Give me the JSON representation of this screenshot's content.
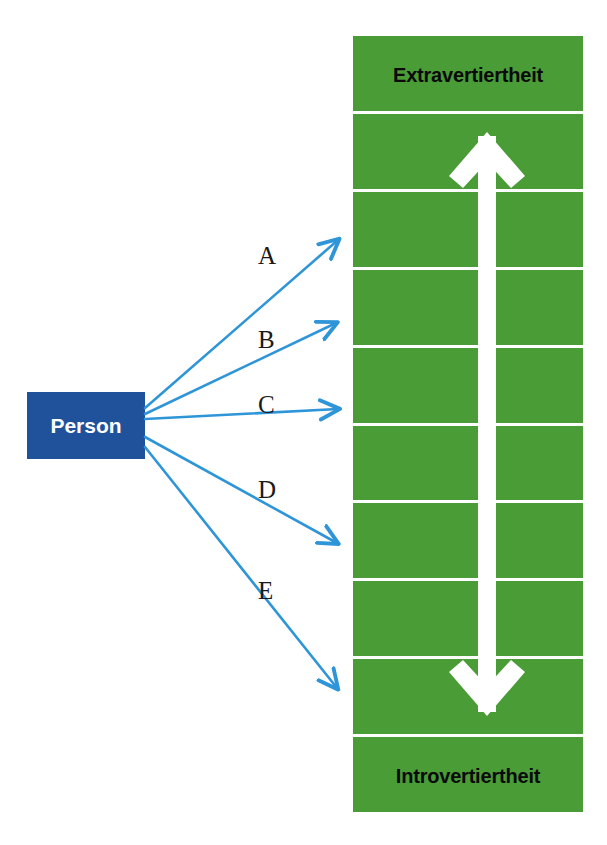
{
  "diagram": {
    "colors": {
      "scale_green": "#4a9c36",
      "person_blue": "#20529c",
      "connector_blue": "#2e95d8",
      "divider_white": "#ffffff",
      "pole_label_text": "#0a0a0a",
      "person_label_text": "#ffffff",
      "connector_label_text": "#1a1a1a",
      "background": "#ffffff"
    }
  },
  "scale": {
    "top_pole_label": "Extravertiertheit",
    "bottom_pole_label": "Introvertiertheit",
    "segment_count": 10,
    "segments": [
      {
        "index": 1,
        "label": "Extravertiertheit"
      },
      {
        "index": 2,
        "label": ""
      },
      {
        "index": 3,
        "label": ""
      },
      {
        "index": 4,
        "label": ""
      },
      {
        "index": 5,
        "label": ""
      },
      {
        "index": 6,
        "label": ""
      },
      {
        "index": 7,
        "label": ""
      },
      {
        "index": 8,
        "label": ""
      },
      {
        "index": 9,
        "label": ""
      },
      {
        "index": 10,
        "label": "Introvertiertheit"
      }
    ],
    "direction_arrow": "vertical-double-headed-arrow"
  },
  "source": {
    "label": "Person"
  },
  "connectors": [
    {
      "id": "A",
      "label": "A",
      "label_x": 258,
      "label_y": 243,
      "from_x": 145,
      "from_y": 408,
      "to_x": 338,
      "to_y": 240
    },
    {
      "id": "B",
      "label": "B",
      "label_x": 258,
      "label_y": 327,
      "from_x": 145,
      "from_y": 414,
      "to_x": 336,
      "to_y": 323
    },
    {
      "id": "C",
      "label": "C",
      "label_x": 258,
      "label_y": 392,
      "from_x": 145,
      "from_y": 419,
      "to_x": 338,
      "to_y": 409
    },
    {
      "id": "D",
      "label": "D",
      "label_x": 258,
      "label_y": 477,
      "from_x": 145,
      "from_y": 437,
      "to_x": 337,
      "to_y": 543
    },
    {
      "id": "E",
      "label": "E",
      "label_x": 258,
      "label_y": 578,
      "from_x": 145,
      "from_y": 447,
      "to_x": 337,
      "to_y": 688
    }
  ]
}
